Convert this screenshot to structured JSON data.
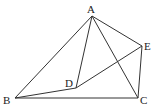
{
  "diagram": {
    "points": {
      "A": {
        "label": "A",
        "x": 92,
        "y": 16
      },
      "B": {
        "label": "B",
        "x": 15,
        "y": 98
      },
      "C": {
        "label": "C",
        "x": 138,
        "y": 98
      },
      "D": {
        "label": "D",
        "x": 76,
        "y": 88
      },
      "E": {
        "label": "E",
        "x": 142,
        "y": 46
      }
    },
    "segments": [
      "AB",
      "AD",
      "AC",
      "AE",
      "BD",
      "DE",
      "BC",
      "EC"
    ]
  }
}
